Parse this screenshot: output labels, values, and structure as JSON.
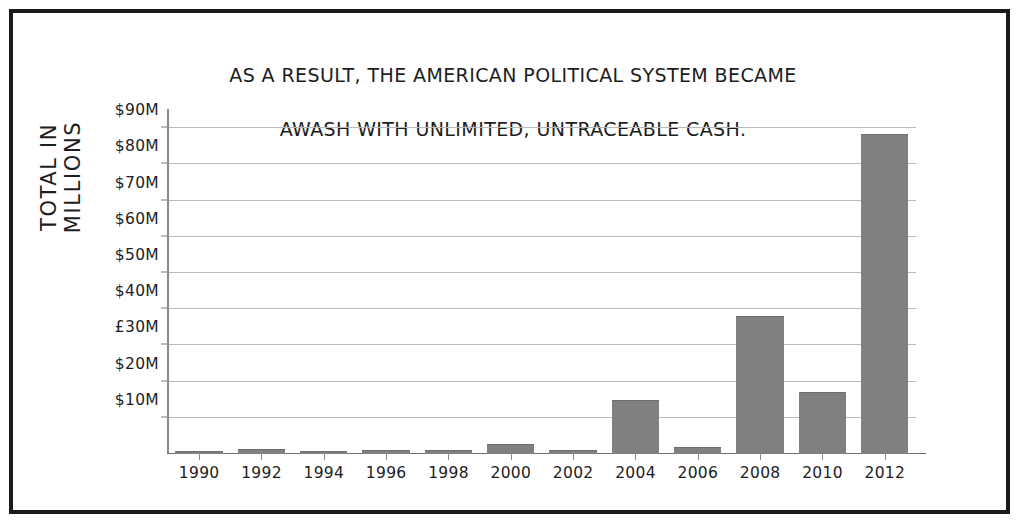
{
  "chart_data": {
    "type": "bar",
    "title": "AS A RESULT, THE AMERICAN POLITICAL SYSTEM BECAME AWASH WITH UNLIMITED, UNTRACEABLE CASH.",
    "title_lines": [
      "AS A RESULT, THE AMERICAN POLITICAL SYSTEM BECAME",
      "AWASH WITH UNLIMITED, UNTRACEABLE CASH."
    ],
    "xlabel": "",
    "ylabel": "TOTAL IN MILLIONS",
    "categories": [
      "1990",
      "1992",
      "1994",
      "1996",
      "1998",
      "2000",
      "2002",
      "2004",
      "2006",
      "2008",
      "2010",
      "2012"
    ],
    "values": [
      0.8,
      1.4,
      0.9,
      1.1,
      1.0,
      2.8,
      1.0,
      15.0,
      1.8,
      38.0,
      17.0,
      88.5
    ],
    "ylim": [
      0,
      95
    ],
    "ytick_values": [
      10,
      20,
      30,
      40,
      50,
      60,
      70,
      80,
      90
    ],
    "ytick_labels": [
      "$10M",
      "$20M",
      "£30M",
      "$40M",
      "$50M",
      "$60M",
      "$70M",
      "$80M",
      "$90M"
    ],
    "grid": true,
    "legend": "none",
    "bar_color": "#808080",
    "gridline_color": "#b9b9b9",
    "axis_color": "#8a8a8a",
    "text_color": "#1d1d1d",
    "border_color": "#1a1a1a",
    "background_color": "#ffffff"
  }
}
